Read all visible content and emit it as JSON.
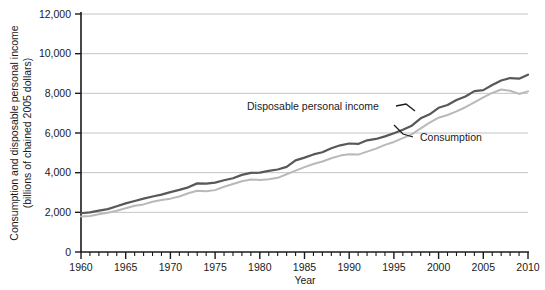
{
  "chart_data": {
    "type": "line",
    "title": "",
    "xlabel": "Year",
    "ylabel": "Consumption and disposable personal income (billions of chained 2005 dollars)",
    "ylabel_line1": "Consumption and disposable personal income",
    "ylabel_line2": "(billions of chained 2005 dollars)",
    "xlim": [
      1960,
      2010
    ],
    "ylim": [
      0,
      12000
    ],
    "grid": "horizontal",
    "legend_position": "inline-annotations",
    "x_tick_labels": [
      "1960",
      "1965",
      "1970",
      "1975",
      "1980",
      "1985",
      "1990",
      "1995",
      "2000",
      "2005",
      "2010"
    ],
    "x_tick_values": [
      1960,
      1965,
      1970,
      1975,
      1980,
      1985,
      1990,
      1995,
      2000,
      2005,
      2010
    ],
    "x_minor_tick_step": 1,
    "y_tick_labels": [
      "0",
      "2,000",
      "4,000",
      "6,000",
      "8,000",
      "10,000",
      "12,000"
    ],
    "y_tick_values": [
      0,
      2000,
      4000,
      6000,
      8000,
      10000,
      12000
    ],
    "x": [
      1960,
      1961,
      1962,
      1963,
      1964,
      1965,
      1966,
      1967,
      1968,
      1969,
      1970,
      1971,
      1972,
      1973,
      1974,
      1975,
      1976,
      1977,
      1978,
      1979,
      1980,
      1981,
      1982,
      1983,
      1984,
      1985,
      1986,
      1987,
      1988,
      1989,
      1990,
      1991,
      1992,
      1993,
      1994,
      1995,
      1996,
      1997,
      1998,
      1999,
      2000,
      2001,
      2002,
      2003,
      2004,
      2005,
      2006,
      2007,
      2008,
      2009,
      2010
    ],
    "series": [
      {
        "name": "Disposable personal income",
        "color": "#58585a",
        "values": [
          1955,
          1995,
          2090,
          2160,
          2310,
          2450,
          2570,
          2690,
          2800,
          2890,
          3020,
          3130,
          3260,
          3460,
          3450,
          3500,
          3620,
          3720,
          3890,
          3990,
          4000,
          4090,
          4160,
          4290,
          4620,
          4760,
          4920,
          5030,
          5230,
          5380,
          5470,
          5450,
          5630,
          5700,
          5830,
          5990,
          6160,
          6370,
          6740,
          6940,
          7270,
          7410,
          7660,
          7840,
          8110,
          8160,
          8420,
          8650,
          8770,
          8740,
          8940
        ],
        "values_scaled_note": "curve drawn from these points"
      },
      {
        "name": "Consumption",
        "color": "#b9b9bb",
        "values": [
          1790,
          1820,
          1900,
          1980,
          2080,
          2210,
          2330,
          2400,
          2530,
          2620,
          2690,
          2800,
          2960,
          3090,
          3060,
          3120,
          3290,
          3430,
          3570,
          3660,
          3630,
          3670,
          3740,
          3920,
          4100,
          4280,
          4440,
          4560,
          4730,
          4860,
          4930,
          4910,
          5060,
          5210,
          5400,
          5550,
          5740,
          5930,
          6230,
          6520,
          6770,
          6910,
          7090,
          7300,
          7550,
          7800,
          8020,
          8190,
          8130,
          7970,
          8100
        ]
      }
    ],
    "annotations": [
      {
        "text": "Disposable personal income",
        "target_series": "Disposable personal income",
        "target_year": 1998
      },
      {
        "text": "Consumption",
        "target_series": "Consumption",
        "target_year": 1997
      }
    ]
  }
}
